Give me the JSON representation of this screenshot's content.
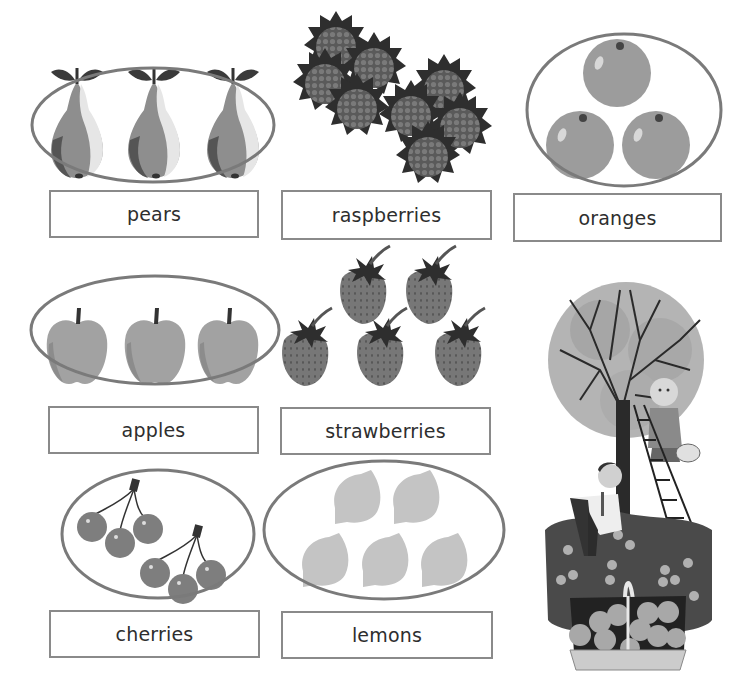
{
  "worksheet": {
    "title_fragment": "",
    "colors": {
      "outline": "#7a7a7a",
      "label_border": "#8a8a8a",
      "label_text": "#2e2e2e",
      "pear": "#8e8e8e",
      "raspberry": "#6e6e6e",
      "orange": "#9c9c9c",
      "apple": "#a2a2a2",
      "strawberry": "#777777",
      "cherry": "#7e7e7e",
      "lemon": "#c4c4c4",
      "leaf": "#3a3a3a"
    },
    "groups": [
      {
        "name": "pears",
        "label": "pears",
        "count": 3,
        "circled": true
      },
      {
        "name": "raspberries",
        "label": "raspberries",
        "count": 8,
        "circled": false
      },
      {
        "name": "oranges",
        "label": "oranges",
        "count": 3,
        "circled": true
      },
      {
        "name": "apples",
        "label": "apples",
        "count": 3,
        "circled": true
      },
      {
        "name": "strawberries",
        "label": "strawberries",
        "count": 5,
        "circled": false
      },
      {
        "name": "cherries",
        "label": "cherries",
        "count": 6,
        "circled": true
      },
      {
        "name": "lemons",
        "label": "lemons",
        "count": 5,
        "circled": true
      }
    ],
    "illustration": {
      "description": "Two children picking fruit from a tree with a ladder, basket of apples in grass"
    }
  }
}
